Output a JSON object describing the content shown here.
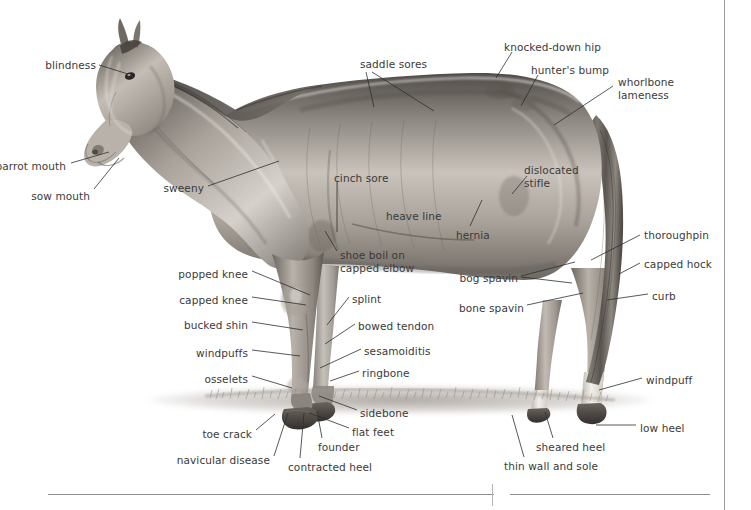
{
  "page": {
    "background_color": "#ffffff",
    "text_color": "#3a3a3a",
    "leader_line_color": "#2e2e2e",
    "rule_color": "#8d8d8d",
    "width": 751,
    "height": 510
  },
  "figure": {
    "ground_label": "grass"
  },
  "labels": [
    {
      "id": "blindness",
      "text": "blindness",
      "align": "right",
      "x": 40,
      "y": 59,
      "w": 56
    },
    {
      "id": "parrot-mouth",
      "text": "parrot mouth",
      "align": "right",
      "x": -6,
      "y": 160,
      "w": 72
    },
    {
      "id": "sow-mouth",
      "text": "sow mouth",
      "align": "right",
      "x": 28,
      "y": 190,
      "w": 62
    },
    {
      "id": "sweeny",
      "text": "sweeny",
      "align": "right",
      "x": 160,
      "y": 182,
      "w": 44
    },
    {
      "id": "saddle-sores",
      "text": "saddle sores",
      "align": "left",
      "x": 360,
      "y": 58,
      "w": 72
    },
    {
      "id": "cinch-sore",
      "text": "cinch sore",
      "align": "left",
      "x": 334,
      "y": 172,
      "w": 60
    },
    {
      "id": "heave-line",
      "text": "heave line",
      "align": "left",
      "x": 386,
      "y": 210,
      "w": 62
    },
    {
      "id": "knocked-down-hip",
      "text": "knocked-down hip",
      "align": "left",
      "x": 504,
      "y": 41,
      "w": 104
    },
    {
      "id": "hunters-bump",
      "text": "hunter's bump",
      "align": "left",
      "x": 531,
      "y": 64,
      "w": 84
    },
    {
      "id": "whorlbone-lameness",
      "text": "whorlbone\nlameness",
      "align": "left",
      "x": 618,
      "y": 76,
      "w": 72
    },
    {
      "id": "dislocated-stifle",
      "text": "dislocated\nstifle",
      "align": "left",
      "x": 524,
      "y": 164,
      "w": 62
    },
    {
      "id": "hernia",
      "text": "hernia",
      "align": "left",
      "x": 456,
      "y": 229,
      "w": 40
    },
    {
      "id": "thoroughpin",
      "text": "thoroughpin",
      "align": "left",
      "x": 644,
      "y": 229,
      "w": 68
    },
    {
      "id": "capped-hock",
      "text": "capped hock",
      "align": "left",
      "x": 644,
      "y": 258,
      "w": 72
    },
    {
      "id": "curb",
      "text": "curb",
      "align": "left",
      "x": 652,
      "y": 290,
      "w": 28
    },
    {
      "id": "bog-spavin",
      "text": "bog spavin",
      "align": "right",
      "x": 456,
      "y": 272,
      "w": 62
    },
    {
      "id": "bone-spavin",
      "text": "bone spavin",
      "align": "right",
      "x": 456,
      "y": 302,
      "w": 68
    },
    {
      "id": "shoe-boil",
      "text": "shoe boil on\ncapped elbow",
      "align": "left",
      "x": 340,
      "y": 249,
      "w": 82
    },
    {
      "id": "popped-knee",
      "text": "popped knee",
      "align": "right",
      "x": 172,
      "y": 268,
      "w": 76
    },
    {
      "id": "capped-knee",
      "text": "capped knee",
      "align": "right",
      "x": 170,
      "y": 294,
      "w": 78
    },
    {
      "id": "bucked-shin",
      "text": "bucked shin",
      "align": "right",
      "x": 170,
      "y": 319,
      "w": 78
    },
    {
      "id": "windpuffs",
      "text": "windpuffs",
      "align": "right",
      "x": 182,
      "y": 347,
      "w": 66
    },
    {
      "id": "osselets",
      "text": "osselets",
      "align": "right",
      "x": 192,
      "y": 373,
      "w": 56
    },
    {
      "id": "splint",
      "text": "splint",
      "align": "left",
      "x": 352,
      "y": 293,
      "w": 36
    },
    {
      "id": "bowed-tendon",
      "text": "bowed tendon",
      "align": "left",
      "x": 358,
      "y": 320,
      "w": 80
    },
    {
      "id": "sesamoiditis",
      "text": "sesamoiditis",
      "align": "left",
      "x": 364,
      "y": 345,
      "w": 72
    },
    {
      "id": "ringbone",
      "text": "ringbone",
      "align": "left",
      "x": 362,
      "y": 367,
      "w": 52
    },
    {
      "id": "sidebone",
      "text": "sidebone",
      "align": "left",
      "x": 360,
      "y": 407,
      "w": 52
    },
    {
      "id": "flat-feet",
      "text": "flat feet",
      "align": "left",
      "x": 352,
      "y": 426,
      "w": 48
    },
    {
      "id": "founder",
      "text": "founder",
      "align": "left",
      "x": 318,
      "y": 441,
      "w": 48
    },
    {
      "id": "toe-crack",
      "text": "toe crack",
      "align": "right",
      "x": 196,
      "y": 428,
      "w": 56
    },
    {
      "id": "navicular-disease",
      "text": "navicular disease",
      "align": "right",
      "x": 174,
      "y": 454,
      "w": 96
    },
    {
      "id": "contracted-heel",
      "text": "contracted heel",
      "align": "left",
      "x": 288,
      "y": 461,
      "w": 90
    },
    {
      "id": "windpuff",
      "text": "windpuff",
      "align": "left",
      "x": 646,
      "y": 374,
      "w": 52
    },
    {
      "id": "low-heel",
      "text": "low heel",
      "align": "left",
      "x": 640,
      "y": 422,
      "w": 48
    },
    {
      "id": "sheared-heel",
      "text": "sheared heel",
      "align": "left",
      "x": 536,
      "y": 441,
      "w": 76
    },
    {
      "id": "thin-wall-and-sole",
      "text": "thin wall and sole",
      "align": "left",
      "x": 504,
      "y": 460,
      "w": 100
    }
  ],
  "leaders": [
    {
      "id": "leader-blindness",
      "points": "99,65 128,74"
    },
    {
      "id": "leader-parrot-mouth",
      "points": "71,163 109,152"
    },
    {
      "id": "leader-sow-mouth",
      "points": "94,189 119,158"
    },
    {
      "id": "leader-sweeny",
      "points": "208,186 279,161"
    },
    {
      "id": "leader-saddle-sores-a",
      "points": "366,72 374,107"
    },
    {
      "id": "leader-saddle-sores-b",
      "points": "372,72 434,111"
    },
    {
      "id": "leader-cinch-sore",
      "points": "337,182 337,232"
    },
    {
      "id": "leader-knocked-down-hip",
      "points": "512,52 496,78"
    },
    {
      "id": "leader-hunters-bump",
      "points": "538,75 521,106"
    },
    {
      "id": "leader-whorlbone",
      "points": "613,86 554,125"
    },
    {
      "id": "leader-dislocated-stifle",
      "points": "527,176 512,194"
    },
    {
      "id": "leader-hernia",
      "points": "470,226 482,200"
    },
    {
      "id": "leader-thoroughpin",
      "points": "640,235 591,260"
    },
    {
      "id": "leader-capped-hock",
      "points": "640,263 619,274"
    },
    {
      "id": "leader-curb",
      "points": "648,294 607,300"
    },
    {
      "id": "leader-bog-spavin-a",
      "points": "521,276 575,262"
    },
    {
      "id": "leader-bog-spavin-b",
      "points": "521,277 572,283"
    },
    {
      "id": "leader-bone-spavin",
      "points": "527,305 583,293"
    },
    {
      "id": "leader-shoe-boil",
      "points": "337,251 325,231"
    },
    {
      "id": "leader-popped-knee",
      "points": "252,271 310,295"
    },
    {
      "id": "leader-capped-knee",
      "points": "252,297 306,305"
    },
    {
      "id": "leader-bucked-shin",
      "points": "252,322 303,330"
    },
    {
      "id": "leader-windpuffs",
      "points": "252,350 300,356"
    },
    {
      "id": "leader-osselets",
      "points": "252,376 292,388"
    },
    {
      "id": "leader-splint",
      "points": "349,297 327,325"
    },
    {
      "id": "leader-bowed-tendon",
      "points": "355,324 325,344"
    },
    {
      "id": "leader-sesamoiditis",
      "points": "361,349 320,368"
    },
    {
      "id": "leader-ringbone",
      "points": "359,371 330,381"
    },
    {
      "id": "leader-sidebone",
      "points": "357,410 319,396"
    },
    {
      "id": "leader-flat-feet",
      "points": "349,428 309,413"
    },
    {
      "id": "leader-founder",
      "points": "322,438 317,411"
    },
    {
      "id": "leader-toe-crack",
      "points": "256,430 275,414"
    },
    {
      "id": "leader-navicular-disease",
      "points": "274,456 288,413"
    },
    {
      "id": "leader-contracted-heel",
      "points": "300,458 304,413"
    },
    {
      "id": "leader-windpuff",
      "points": "642,378 599,390"
    },
    {
      "id": "leader-low-heel",
      "points": "636,425 596,425"
    },
    {
      "id": "leader-sheared-heel",
      "points": "553,438 545,412"
    },
    {
      "id": "leader-thin-wall",
      "points": "524,457 512,415"
    }
  ],
  "rules": [
    {
      "id": "rule-left",
      "x": 48,
      "y": 494,
      "w": 446
    },
    {
      "id": "rule-right",
      "x": 510,
      "y": 494,
      "w": 200
    }
  ],
  "dividers": [
    {
      "id": "divider-right-margin",
      "x": 724,
      "y": 0,
      "h": 510
    },
    {
      "id": "divider-column-tick",
      "x": 492,
      "y": 484,
      "h": 22
    }
  ]
}
